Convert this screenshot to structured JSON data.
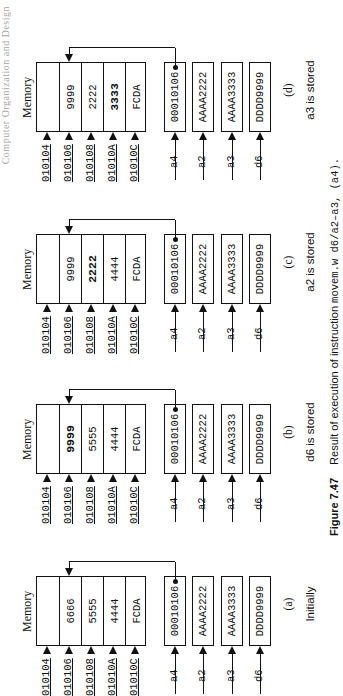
{
  "header": {
    "partial_text": "Computer Organization and Design"
  },
  "figure": {
    "number": "Figure 7.47",
    "caption_text": "Result of execution of instruction",
    "caption_code": "movem.w d6/a2–a3, (a4)."
  },
  "memory_title": "Memory",
  "addresses": [
    "010104",
    "010106",
    "010108",
    "01010A",
    "01010C"
  ],
  "register_names": [
    "a4",
    "a2",
    "a3",
    "d6"
  ],
  "panels": [
    {
      "id": "a",
      "letter": "(a)",
      "caption": "Initially",
      "memory": [
        "",
        "6666",
        "5555",
        "4444",
        "FCDA"
      ],
      "bold_index": -1,
      "registers": [
        "00010106",
        "AAAA2222",
        "AAAA3333",
        "DDDD9999"
      ]
    },
    {
      "id": "b",
      "letter": "(b)",
      "caption": "d6  is stored",
      "memory": [
        "",
        "9999",
        "5555",
        "4444",
        "FCDA"
      ],
      "bold_index": 1,
      "registers": [
        "00010106",
        "AAAA2222",
        "AAAA3333",
        "DDDD9999"
      ]
    },
    {
      "id": "c",
      "letter": "(c)",
      "caption": "a2  is stored",
      "memory": [
        "",
        "9999",
        "2222",
        "4444",
        "FCDA"
      ],
      "bold_index": 2,
      "registers": [
        "00010106",
        "AAAA2222",
        "AAAA3333",
        "DDDD9999"
      ]
    },
    {
      "id": "d",
      "letter": "(d)",
      "caption": "a3  is stored",
      "memory": [
        "",
        "9999",
        "2222",
        "3333",
        "FCDA"
      ],
      "bold_index": 3,
      "registers": [
        "00010106",
        "AAAA2222",
        "AAAA3333",
        "DDDD9999"
      ]
    }
  ]
}
